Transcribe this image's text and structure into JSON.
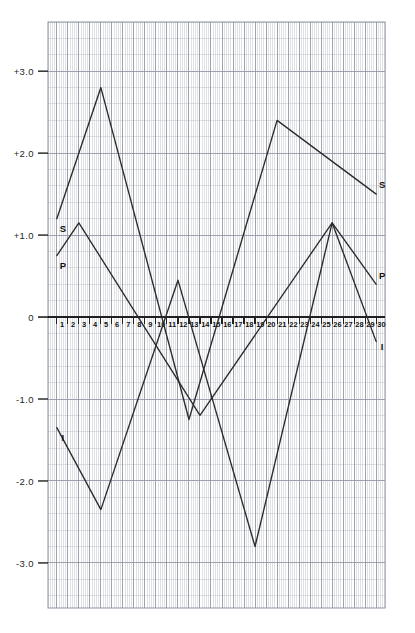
{
  "chart_data": {
    "type": "line",
    "title": "",
    "xlabel": "",
    "ylabel": "",
    "xlim": [
      0.2,
      30.8
    ],
    "ylim": [
      -3.55,
      3.6
    ],
    "grid": true,
    "grid_minor_step_x": 0.2,
    "grid_minor_step_y": 0.2,
    "grid_major_step_x": 1,
    "grid_major_step_y": 1,
    "legend": "inline-endpoint-labels",
    "y_tick_labels": [
      "+3.0",
      "+2.0",
      "+1.0",
      "0",
      "-1.0",
      "-2.0",
      "-3.0"
    ],
    "y_ticks": [
      3,
      2,
      1,
      0,
      -1,
      -2,
      -3
    ],
    "x_ticks": [
      1,
      2,
      3,
      4,
      5,
      6,
      7,
      8,
      9,
      10,
      11,
      12,
      13,
      14,
      15,
      16,
      17,
      18,
      19,
      20,
      21,
      22,
      23,
      24,
      25,
      26,
      27,
      28,
      29,
      30
    ],
    "x_tick_labels": [
      "1",
      "2",
      "3",
      "4",
      "5",
      "6",
      "7",
      "8",
      "9",
      "10",
      "11",
      "12",
      "13",
      "14",
      "15",
      "16",
      "17",
      "18",
      "19",
      "20",
      "21",
      "22",
      "23",
      "24",
      "25",
      "26",
      "27",
      "28",
      "29",
      "30"
    ],
    "series": [
      {
        "name": "S",
        "label_left": "S",
        "label_right": "S",
        "color": "#2b2b2b",
        "x": [
          1,
          5,
          13,
          21,
          30
        ],
        "values": [
          1.2,
          2.8,
          -1.25,
          2.4,
          1.5
        ]
      },
      {
        "name": "P",
        "label_left": "P",
        "label_right": "P",
        "color": "#2b2b2b",
        "x": [
          1,
          3,
          14,
          26,
          30
        ],
        "values": [
          0.75,
          1.15,
          -1.2,
          1.15,
          0.4
        ]
      },
      {
        "name": "I",
        "label_left": "I",
        "label_right": "I",
        "color": "#2b2b2b",
        "x": [
          1,
          5,
          12,
          19,
          26,
          30
        ],
        "values": [
          -1.35,
          -2.35,
          0.45,
          -2.8,
          1.15,
          -0.3
        ]
      }
    ]
  },
  "figure": {
    "caption": "",
    "grid_color": "#b9bcc6",
    "grid_major_color": "#8e93a1",
    "axis_color": "#1f1f1f",
    "curve_color": "#2b2b2b",
    "plot_bg": "#ffffff"
  }
}
